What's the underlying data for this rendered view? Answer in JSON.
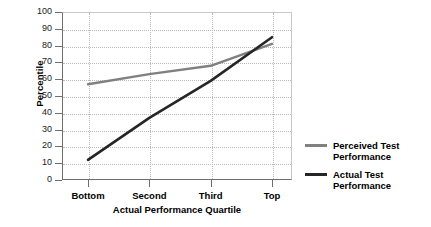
{
  "chart_data": {
    "type": "line",
    "title": "",
    "xlabel": "Actual Performance Quartile",
    "ylabel": "Percentile",
    "categories": [
      "Bottom",
      "Second",
      "Third",
      "Top"
    ],
    "ylim": [
      0,
      100
    ],
    "yticks": [
      0,
      10,
      20,
      30,
      40,
      50,
      60,
      70,
      80,
      90,
      100
    ],
    "grid": true,
    "legend_position": "right",
    "series": [
      {
        "name": "Perceived Test Performance",
        "color": "#808080",
        "values": [
          57,
          63,
          68,
          81
        ]
      },
      {
        "name": "Actual Test Performance",
        "color": "#262626",
        "values": [
          12,
          37,
          59,
          85
        ]
      }
    ]
  },
  "axes": {
    "y_title": "Percentile",
    "x_title": "Actual Performance Quartile",
    "y_tick_labels": [
      "100",
      "90",
      "80",
      "70",
      "60",
      "50",
      "40",
      "30",
      "20",
      "10",
      "0"
    ],
    "x_tick_labels": [
      "Bottom",
      "Second",
      "Third",
      "Top"
    ]
  },
  "legend": {
    "items": [
      {
        "label_line1": "Perceived Test",
        "label_line2": "Performance",
        "color": "#808080"
      },
      {
        "label_line1": "Actual Test",
        "label_line2": "Performance",
        "color": "#262626"
      }
    ]
  }
}
